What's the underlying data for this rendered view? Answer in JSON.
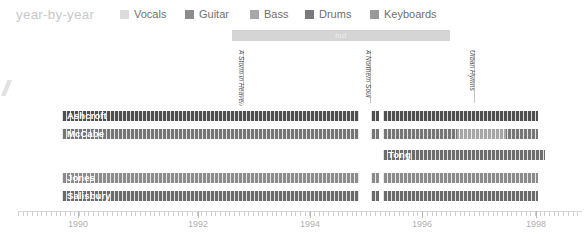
{
  "header": {
    "title": "year-by-year",
    "legend": [
      {
        "label": "Vocals",
        "color": "#dcdcdc",
        "x": 120
      },
      {
        "label": "Guitar",
        "color": "#8c8c8c",
        "x": 185
      },
      {
        "label": "Bass",
        "color": "#a8a8a8",
        "x": 250
      },
      {
        "label": "Drums",
        "color": "#7a7a7a",
        "x": 305
      },
      {
        "label": "Keyboards",
        "color": "#999999",
        "x": 370
      }
    ]
  },
  "phase_bars": [
    {
      "label": "hut",
      "x": 232,
      "width": 218,
      "color": "#d5d5d5"
    }
  ],
  "albums": [
    {
      "label": "A Storm in Heaven",
      "x": 243,
      "top": 50,
      "height": 53
    },
    {
      "label": "A Northern Soul",
      "x": 370,
      "top": 50,
      "height": 53
    },
    {
      "label": "Urban Hymns",
      "x": 474,
      "top": 50,
      "height": 53
    }
  ],
  "axis": {
    "years": [
      {
        "label": "1990",
        "x": 60
      },
      {
        "label": "1992",
        "x": 180
      },
      {
        "label": "1994",
        "x": 292
      },
      {
        "label": "1996",
        "x": 404
      },
      {
        "label": "1998",
        "x": 518
      }
    ],
    "majorTicks": [
      60,
      180,
      292,
      404,
      518
    ]
  },
  "members": [
    {
      "name": "Ashcroft",
      "role": "Vocals",
      "top": 8,
      "segments": [
        {
          "x": 44,
          "width": 297,
          "color": "#4f4f4f"
        },
        {
          "x": 353,
          "width": 8,
          "color": "#4f4f4f"
        },
        {
          "x": 365,
          "width": 155,
          "color": "#4f4f4f"
        }
      ]
    },
    {
      "name": "McCabe",
      "role": "Guitar",
      "top": 26,
      "segments": [
        {
          "x": 44,
          "width": 297,
          "color": "#767676"
        },
        {
          "x": 353,
          "width": 8,
          "color": "#767676"
        },
        {
          "x": 365,
          "width": 74,
          "color": "#767676"
        },
        {
          "x": 439,
          "width": 49,
          "color": "#a6a6a6"
        },
        {
          "x": 488,
          "width": 32,
          "color": "#767676"
        }
      ]
    },
    {
      "name": "Tong",
      "role": "Keyboards",
      "top": 47,
      "segments": [
        {
          "x": 365,
          "width": 162,
          "color": "#6d6d6d"
        }
      ]
    },
    {
      "name": "Jones",
      "role": "Bass",
      "top": 70,
      "segments": [
        {
          "x": 44,
          "width": 297,
          "color": "#8b8b8b"
        },
        {
          "x": 353,
          "width": 8,
          "color": "#8b8b8b"
        },
        {
          "x": 365,
          "width": 155,
          "color": "#8b8b8b"
        }
      ]
    },
    {
      "name": "Salisbury",
      "role": "Drums",
      "top": 88,
      "segments": [
        {
          "x": 44,
          "width": 297,
          "color": "#6b6b6b"
        },
        {
          "x": 353,
          "width": 8,
          "color": "#6b6b6b"
        },
        {
          "x": 365,
          "width": 155,
          "color": "#6b6b6b"
        }
      ]
    }
  ],
  "chart_data": {
    "type": "bar",
    "title": "year-by-year",
    "xlabel": "",
    "ylabel": "",
    "xlim": [
      1989,
      1999.5
    ],
    "categories": [
      "Ashcroft",
      "McCabe",
      "Tong",
      "Jones",
      "Salisbury"
    ],
    "legend_position": "top",
    "grid": false,
    "series": [
      {
        "name": "Ashcroft",
        "instrument": "Vocals",
        "spans": [
          [
            1989.4,
            1995.1
          ],
          [
            1995.3,
            1995.5
          ],
          [
            1995.7,
            1998.9
          ]
        ]
      },
      {
        "name": "McCabe",
        "instrument": "Guitar",
        "spans": [
          [
            1989.4,
            1995.1
          ],
          [
            1995.3,
            1995.5
          ],
          [
            1995.7,
            1997.1
          ],
          [
            1997.1,
            1998.0
          ],
          [
            1998.0,
            1998.9
          ]
        ]
      },
      {
        "name": "Tong",
        "instrument": "Keyboards",
        "spans": [
          [
            1995.7,
            1999.0
          ]
        ]
      },
      {
        "name": "Jones",
        "instrument": "Bass",
        "spans": [
          [
            1989.4,
            1995.1
          ],
          [
            1995.3,
            1995.5
          ],
          [
            1995.7,
            1998.9
          ]
        ]
      },
      {
        "name": "Salisbury",
        "instrument": "Drums",
        "spans": [
          [
            1989.4,
            1995.1
          ],
          [
            1995.3,
            1995.5
          ],
          [
            1995.7,
            1998.9
          ]
        ]
      }
    ],
    "annotations": [
      {
        "label": "A Storm in Heaven",
        "year": 1993.2
      },
      {
        "label": "A Northern Soul",
        "year": 1995.5
      },
      {
        "label": "Urban Hymns",
        "year": 1997.4
      },
      {
        "label": "hut",
        "year_range": [
          1993.0,
          1997.0
        ]
      }
    ]
  }
}
